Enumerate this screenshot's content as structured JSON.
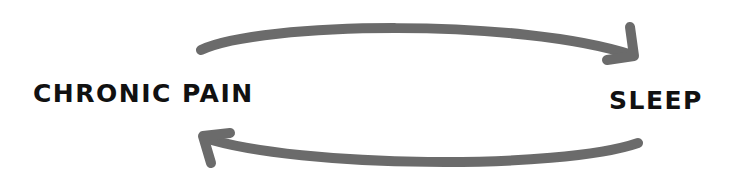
{
  "diagram": {
    "type": "cycle",
    "nodes": [
      {
        "id": "chronic-pain",
        "label": "CHRONIC PAIN"
      },
      {
        "id": "sleep",
        "label": "SLEEP"
      }
    ],
    "edges": [
      {
        "from": "chronic-pain",
        "to": "sleep",
        "direction": "right",
        "position": "top"
      },
      {
        "from": "sleep",
        "to": "chronic-pain",
        "direction": "left",
        "position": "bottom"
      }
    ],
    "colors": {
      "arrow": "#6b6b6b",
      "text": "#111111",
      "background": "#ffffff"
    }
  }
}
